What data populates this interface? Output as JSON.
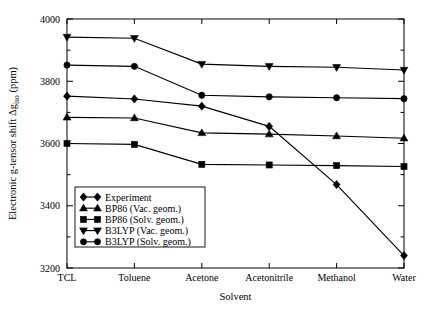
{
  "chart_data": {
    "type": "line",
    "title": "",
    "xlabel": "Solvent",
    "ylabel": "Electronic g-tensor shift Δg",
    "ylabel_sub": "iso",
    "ylabel_unit": "(ppm)",
    "categories": [
      "TCL",
      "Toluene",
      "Acetone",
      "Acetonitrile",
      "Methanol",
      "Water"
    ],
    "ylim": [
      3200,
      4000
    ],
    "yticks": [
      3200,
      3400,
      3600,
      3800,
      4000
    ],
    "ytick_labels": [
      "3200",
      "3400",
      "3600",
      "3800",
      "4000"
    ],
    "yminor_step": 100,
    "grid": false,
    "legend_position": "lower-left-inside",
    "series": [
      {
        "name": "Experiment",
        "marker": "diamond",
        "values": [
          3752,
          3743,
          3720,
          3655,
          3468,
          3240
        ]
      },
      {
        "name": "BP86   (Vac.  geom.)",
        "marker": "triangle-up",
        "values": [
          3684,
          3682,
          3634,
          3630,
          3624,
          3617
        ]
      },
      {
        "name": "BP86   (Solv. geom.)",
        "marker": "square",
        "values": [
          3600,
          3597,
          3533,
          3531,
          3529,
          3526
        ]
      },
      {
        "name": "B3LYP (Vac.  geom.)",
        "marker": "triangle-down",
        "values": [
          3942,
          3938,
          3855,
          3848,
          3845,
          3836
        ]
      },
      {
        "name": "B3LYP (Solv. geom.)",
        "marker": "circle",
        "values": [
          3852,
          3848,
          3755,
          3750,
          3747,
          3744
        ]
      }
    ]
  },
  "legend": {
    "entries": [
      {
        "label": "Experiment",
        "marker": "diamond"
      },
      {
        "label": "BP86   (Vac.  geom.)",
        "marker": "triangle-up"
      },
      {
        "label": "BP86   (Solv. geom.)",
        "marker": "square"
      },
      {
        "label": "B3LYP (Vac.  geom.)",
        "marker": "triangle-down"
      },
      {
        "label": "B3LYP (Solv. geom.)",
        "marker": "circle"
      }
    ]
  },
  "colors": {
    "line": "#000000",
    "marker": "#000000",
    "frame": "#000000",
    "background": "#ffffff"
  }
}
